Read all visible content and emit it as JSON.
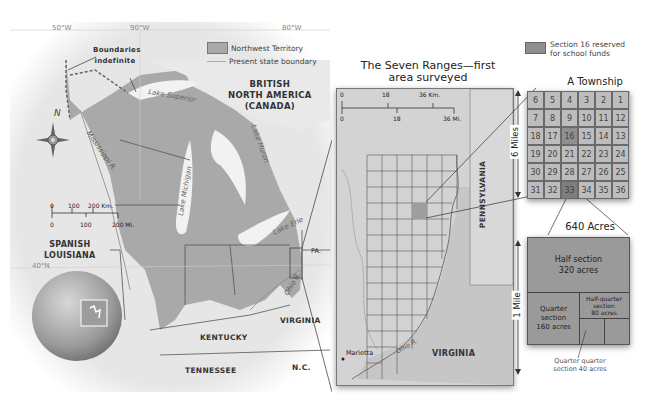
{
  "main_map": {
    "longitude_labels": [
      "50°W",
      "90°W",
      "80°W"
    ],
    "latitude_label": "40°N",
    "legend": {
      "northwest_territory": "Northwest Territory",
      "state_boundary": "Present state boundary"
    },
    "annotation_boundaries": "Boundaries indefinite",
    "regions": {
      "british_north_america": [
        "BRITISH",
        "NORTH AMERICA",
        "(CANADA)"
      ],
      "spanish_louisiana": [
        "SPANISH",
        "LOUISIANA"
      ],
      "kentucky": "KENTUCKY",
      "tennessee": "TENNESSEE",
      "virginia": "VIRGINIA",
      "nc": "N.C.",
      "pa": "PA."
    },
    "water": {
      "lake_superior": "Lake Superior",
      "lake_michigan": "Lake Michigan",
      "lake_huron": "Lake Huron",
      "lake_erie": "Lake Erie",
      "mississippi": "Mississippi R.",
      "ohio": "Ohio R."
    },
    "compass_north": "N",
    "scale": {
      "km_labels": [
        "0",
        "100",
        "200 Km."
      ],
      "mi_labels": [
        "0",
        "100",
        "200 Mi."
      ]
    }
  },
  "seven_ranges": {
    "title_line1": "The Seven Ranges—first",
    "title_line2": "area surveyed",
    "scale": {
      "km_labels": [
        "0",
        "18",
        "36 Km."
      ],
      "mi_labels": [
        "0",
        "18",
        "36 Mi."
      ]
    },
    "labels": {
      "pennsylvania": "PENNSYLVANIA",
      "virginia": "VIRGINIA",
      "marietta": "Marietta",
      "ohio_river": "Ohio R."
    }
  },
  "township": {
    "legend_text_line1": "Section 16 reserved",
    "legend_text_line2": "for school funds",
    "title": "A Township",
    "side_label": "6 Miles",
    "rows": [
      [
        "6",
        "5",
        "4",
        "3",
        "2",
        "1"
      ],
      [
        "7",
        "8",
        "9",
        "10",
        "11",
        "12"
      ],
      [
        "18",
        "17",
        "16",
        "15",
        "14",
        "13"
      ],
      [
        "19",
        "20",
        "21",
        "22",
        "23",
        "24"
      ],
      [
        "30",
        "29",
        "28",
        "27",
        "26",
        "25"
      ],
      [
        "31",
        "32",
        "33",
        "34",
        "35",
        "36"
      ]
    ],
    "highlight_section": "16",
    "zoom_section": "33"
  },
  "section": {
    "title": "640 Acres",
    "side_label": "1 Mile",
    "half_line1": "Half section",
    "half_line2": "320 acres",
    "quarter_line1": "Quarter",
    "quarter_line2": "section",
    "quarter_line3": "160 acres",
    "halfq_line1": "Half-quarter",
    "halfq_line2": "section",
    "halfq_line3": "80 acres",
    "qq_line1": "Quarter quarter",
    "qq_line2": "section 40 acres"
  },
  "colors": {
    "territory": "#a9a9a9",
    "land": "#e4e4e4",
    "water": "#f2f2f2",
    "border": "#555555",
    "highlight": "#8f8f8f"
  }
}
